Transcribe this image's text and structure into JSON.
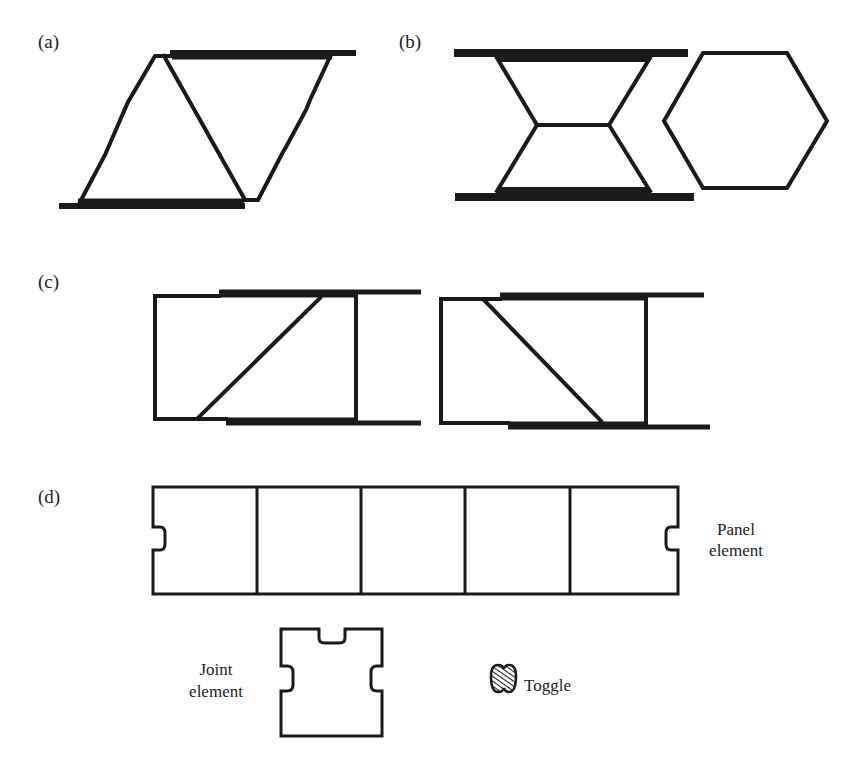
{
  "figure": {
    "panels": [
      {
        "id": "a",
        "label": "(a)",
        "description": "Parallelogram linkage with diagonal member between two thick horizontal plates"
      },
      {
        "id": "b",
        "label": "(b)",
        "description": "Re-entrant (bow-tie) cell between two plates, next to a regular hexagon cell"
      },
      {
        "id": "c",
        "label": "(c)",
        "description": "Two rectangular frames with diagonal braces of opposite orientation between sliding plates"
      },
      {
        "id": "d",
        "label": "(d)",
        "description": "Panel element with five compartments, joint element and toggle"
      }
    ],
    "annotations": {
      "panel_element_line1": "Panel",
      "panel_element_line2": "element",
      "joint_element_line1": "Joint",
      "joint_element_line2": "element",
      "toggle": "Toggle"
    },
    "colors": {
      "stroke": "#1a1a1a",
      "background": "#ffffff"
    }
  }
}
